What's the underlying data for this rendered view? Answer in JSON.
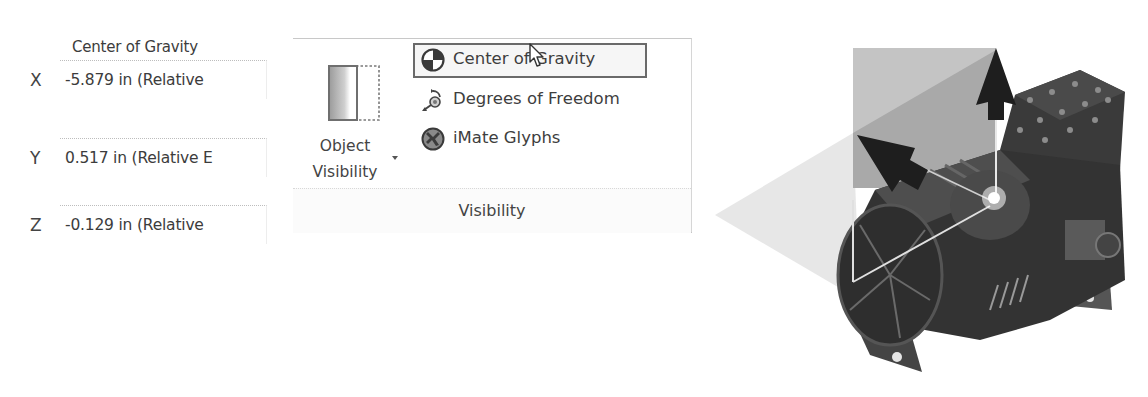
{
  "properties": {
    "title": "Center of Gravity",
    "rows": [
      {
        "axis": "X",
        "value": "-5.879 in (Relative"
      },
      {
        "axis": "Y",
        "value": "0.517 in (Relative E"
      },
      {
        "axis": "Z",
        "value": "-0.129 in (Relative"
      }
    ]
  },
  "ribbon": {
    "group_label": "Visibility",
    "big_button": {
      "line1": "Object",
      "line2": "Visibility",
      "icon": "object-visibility-icon"
    },
    "items": [
      {
        "label": "Center of Gravity",
        "icon": "center-of-gravity-icon",
        "active": true
      },
      {
        "label": "Degrees of Freedom",
        "icon": "degrees-of-freedom-icon",
        "active": false
      },
      {
        "label": "iMate Glyphs",
        "icon": "imate-glyphs-icon",
        "active": false
      }
    ]
  },
  "viewport": {
    "model": "compressor-assembly",
    "overlay": "center-of-gravity-triad"
  }
}
